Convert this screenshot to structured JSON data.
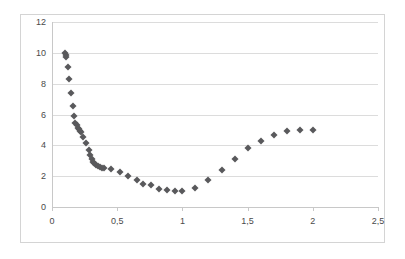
{
  "chart_data": {
    "type": "scatter",
    "title": "",
    "xlabel": "",
    "ylabel": "",
    "xlim": [
      0,
      2.5
    ],
    "ylim": [
      0,
      12
    ],
    "grid": true,
    "legend": "none",
    "marker": {
      "shape": "diamond",
      "color": "#59595c",
      "size": 5
    },
    "x_tick_labels": [
      "0",
      "0,5",
      "1",
      "1,5",
      "2",
      "2,5"
    ],
    "x_tick_values": [
      0,
      0.5,
      1,
      1.5,
      2,
      2.5
    ],
    "y_tick_labels": [
      "0",
      "2",
      "4",
      "6",
      "8",
      "10",
      "12"
    ],
    "y_tick_values": [
      0,
      2,
      4,
      6,
      8,
      10,
      12
    ],
    "points": [
      [
        0.1,
        10.0
      ],
      [
        0.105,
        9.85
      ],
      [
        0.11,
        9.75
      ],
      [
        0.12,
        9.1
      ],
      [
        0.13,
        8.3
      ],
      [
        0.145,
        7.4
      ],
      [
        0.16,
        6.55
      ],
      [
        0.17,
        5.9
      ],
      [
        0.18,
        5.45
      ],
      [
        0.19,
        5.3
      ],
      [
        0.2,
        5.15
      ],
      [
        0.21,
        5.05
      ],
      [
        0.215,
        4.95
      ],
      [
        0.225,
        4.85
      ],
      [
        0.24,
        4.55
      ],
      [
        0.26,
        4.15
      ],
      [
        0.28,
        3.7
      ],
      [
        0.295,
        3.35
      ],
      [
        0.305,
        3.1
      ],
      [
        0.315,
        2.95
      ],
      [
        0.325,
        2.85
      ],
      [
        0.335,
        2.75
      ],
      [
        0.35,
        2.65
      ],
      [
        0.365,
        2.6
      ],
      [
        0.38,
        2.55
      ],
      [
        0.395,
        2.5
      ],
      [
        0.45,
        2.45
      ],
      [
        0.52,
        2.25
      ],
      [
        0.58,
        2.0
      ],
      [
        0.65,
        1.75
      ],
      [
        0.7,
        1.5
      ],
      [
        0.76,
        1.4
      ],
      [
        0.82,
        1.2
      ],
      [
        0.88,
        1.1
      ],
      [
        0.94,
        1.05
      ],
      [
        1.0,
        1.05
      ],
      [
        1.1,
        1.25
      ],
      [
        1.2,
        1.75
      ],
      [
        1.3,
        2.4
      ],
      [
        1.4,
        3.1
      ],
      [
        1.5,
        3.8
      ],
      [
        1.6,
        4.3
      ],
      [
        1.7,
        4.7
      ],
      [
        1.8,
        4.9
      ],
      [
        1.9,
        5.0
      ],
      [
        2.0,
        5.0
      ]
    ]
  }
}
